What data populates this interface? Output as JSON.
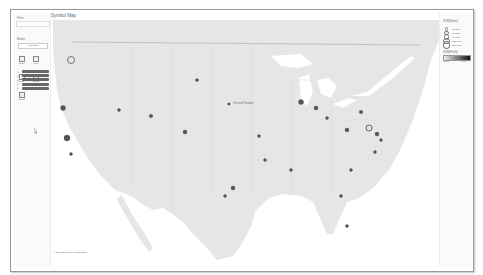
{
  "left_panel": {
    "filter1_label": "Filter",
    "filter2_label": "Marks",
    "dropdown_value": "Automatic",
    "shape_buttons": [
      {
        "label": "Color",
        "icon": "color-icon"
      },
      {
        "label": "Size",
        "icon": "size-icon"
      },
      {
        "label": "Label",
        "icon": "label-icon"
      },
      {
        "label": "Detail",
        "icon": "detail-icon"
      },
      {
        "label": "Tooltip",
        "icon": "tooltip-icon"
      }
    ],
    "pills": [
      {
        "prefix": "◎"
      },
      {
        "prefix": "◎"
      },
      {
        "prefix": "◎"
      },
      {
        "prefix": "◎"
      },
      {
        "prefix": "◎"
      }
    ]
  },
  "main": {
    "title": "Symbol Map",
    "attribution": "© OpenStreetMap contributors",
    "map_labels": [
      "United States"
    ]
  },
  "right_panel": {
    "size_legend_title": "SUM(Sales)",
    "size_values": [
      "30,000",
      "60,000",
      "90,000",
      "120,000",
      "150,000"
    ],
    "color_legend_title": "SUM(Profit)",
    "color_min": "-3,700",
    "color_max": "7,300",
    "gradient_start": "#eeeeee",
    "gradient_end": "#111111"
  }
}
